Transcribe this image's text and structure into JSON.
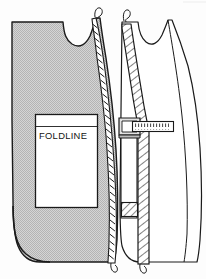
{
  "figure": {
    "background_color": "#fdfdfd",
    "ink_color": "#1a1a1a",
    "shade_color": "#c6c6c6"
  },
  "labels": {
    "foldline": "FOLDLINE"
  },
  "left_piece": {
    "name": "shaded-front-pattern-piece",
    "fill": "#c6c6c6",
    "outline": "#1a1a1a",
    "edge_finish": "zigzag-stitched-edge"
  },
  "right_piece": {
    "name": "outline-front-pattern-piece",
    "fill": "#ffffff",
    "outline": "#1a1a1a",
    "facing_band": "diagonal-hatched-facing-band",
    "tab": "hatched-corner-tab",
    "ruler": "horizontal-measuring-tape"
  },
  "icons": {
    "thread_top_left": "thread-loop-icon",
    "thread_bottom_left": "thread-loop-icon",
    "thread_top_right": "thread-loop-icon",
    "thread_bottom_right": "thread-loop-icon"
  }
}
